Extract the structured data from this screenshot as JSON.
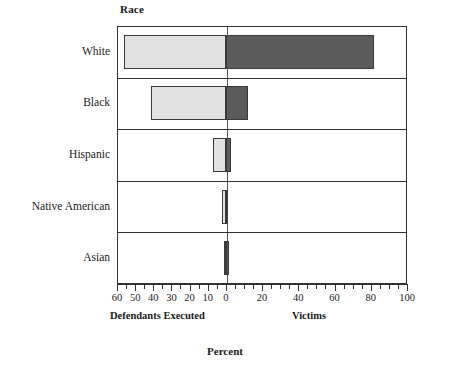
{
  "chart_data": {
    "type": "bar",
    "orientation": "horizontal-diverging",
    "title": "",
    "ylabel": "Race",
    "xlabel": "Percent",
    "categories": [
      "White",
      "Black",
      "Hispanic",
      "Native American",
      "Asian"
    ],
    "series": [
      {
        "name": "Defendants Executed",
        "side": "left",
        "color": "#e2e2e2",
        "values": [
          56,
          41,
          7,
          2,
          0.5
        ]
      },
      {
        "name": "Victims",
        "side": "right",
        "color": "#5b5b5b",
        "values": [
          82,
          12,
          3,
          0.5,
          2
        ]
      }
    ],
    "xlim": [
      -60,
      100
    ],
    "xticks_left": [
      60,
      50,
      40,
      30,
      20,
      10,
      0
    ],
    "xticks_right": [
      20,
      40,
      60,
      80,
      100
    ],
    "xtick_labels": [
      "60",
      "50",
      "40",
      "30",
      "20",
      "10",
      "0",
      "20",
      "40",
      "60",
      "80",
      "100"
    ],
    "minor_tick_step": 5,
    "grid": false,
    "legend": "none",
    "left_caption": "Defendants Executed",
    "right_caption": "Victims"
  },
  "axis": {
    "y_axis_title": "Race",
    "x_axis_title": "Percent"
  },
  "colors": {
    "left_bar": "#e2e2e2",
    "right_bar": "#5b5b5b",
    "frame": "#333333",
    "background": "#ffffff"
  }
}
